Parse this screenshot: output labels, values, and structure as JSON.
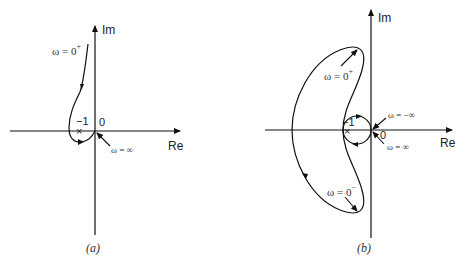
{
  "figures": [
    {
      "id": "a",
      "caption": "(a)",
      "axis_labels": {
        "imag": "Im",
        "real": "Re"
      },
      "origin_label": "0",
      "critical_point_label": "−1",
      "annotations": [
        {
          "omega_prefix": "ω = 0",
          "superscript": "+"
        },
        {
          "omega_prefix": "ω = ∞",
          "superscript": ""
        }
      ]
    },
    {
      "id": "b",
      "caption": "(b)",
      "axis_labels": {
        "imag": "Im",
        "real": "Re"
      },
      "origin_label": "0",
      "critical_point_label": "−1",
      "annotations": [
        {
          "omega_prefix": "ω = 0",
          "superscript": "+"
        },
        {
          "omega_prefix": "ω = −∞",
          "superscript": ""
        },
        {
          "omega_prefix": "ω = ∞",
          "superscript": ""
        },
        {
          "omega_prefix": "ω = 0",
          "superscript": "−"
        }
      ]
    }
  ],
  "colors": {
    "stroke": "#111111",
    "background": "#ffffff"
  }
}
